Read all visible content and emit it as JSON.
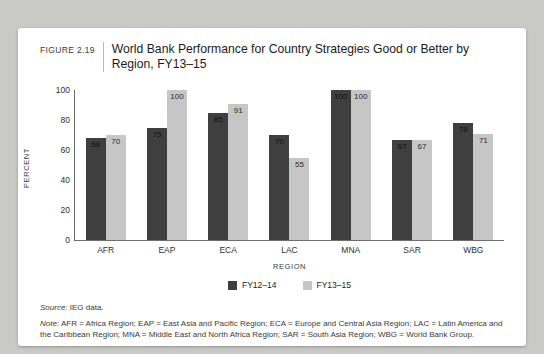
{
  "figure": {
    "number": "FIGURE 2.19",
    "title": "World Bank Performance for Country Strategies Good or Better by Region, FY13–15"
  },
  "source": {
    "lead": "Source:",
    "text": " IEG data."
  },
  "note": {
    "lead": "Note:",
    "text": " AFR = Africa Region; EAP = East Asia and Pacific Region; ECA = Europe and Central Asia Region; LAC = Latin America and the Caribbean Region; MNA = Middle East and North Africa Region; SAR = South Asia Region; WBG = World Bank Group."
  },
  "chart_data": {
    "type": "bar",
    "title": "World Bank Performance for Country Strategies Good or Better by Region, FY13–15",
    "xlabel": "REGION",
    "ylabel": "PERCENT",
    "ylim": [
      0,
      100
    ],
    "yticks": [
      100,
      80,
      60,
      40,
      20,
      0
    ],
    "grid": false,
    "legend_position": "bottom-center",
    "categories": [
      "AFR",
      "EAP",
      "ECA",
      "LAC",
      "MNA",
      "SAR",
      "WBG"
    ],
    "series": [
      {
        "name": "FY12–14",
        "color": "#3f3f3f",
        "values": [
          68,
          75,
          85,
          70,
          100,
          67,
          78
        ]
      },
      {
        "name": "FY13–15",
        "color": "#c6c6c6",
        "values": [
          70,
          100,
          91,
          55,
          100,
          67,
          71
        ]
      }
    ]
  }
}
